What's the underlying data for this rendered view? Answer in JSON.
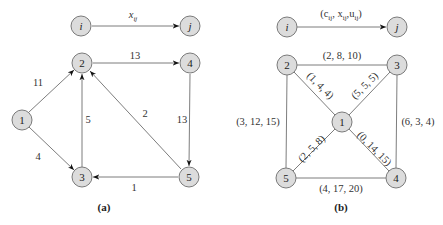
{
  "diagrams": [
    {
      "id": "a",
      "caption": "(a)",
      "legend": {
        "from": "i",
        "to": "j",
        "label": "x",
        "label_sub": "ij"
      },
      "nodes": [
        {
          "id": "1",
          "x": 22,
          "y": 120
        },
        {
          "id": "2",
          "x": 82,
          "y": 63
        },
        {
          "id": "3",
          "x": 82,
          "y": 177
        },
        {
          "id": "4",
          "x": 190,
          "y": 63
        },
        {
          "id": "5",
          "x": 189,
          "y": 177
        }
      ],
      "edges": [
        {
          "from": "1",
          "to": "2",
          "label": "11",
          "directed": true
        },
        {
          "from": "1",
          "to": "3",
          "label": "4",
          "directed": true
        },
        {
          "from": "3",
          "to": "2",
          "label": "5",
          "directed": true
        },
        {
          "from": "2",
          "to": "4",
          "label": "13",
          "directed": true
        },
        {
          "from": "5",
          "to": "2",
          "label": "2",
          "directed": true
        },
        {
          "from": "4",
          "to": "5",
          "label": "13",
          "directed": true
        },
        {
          "from": "5",
          "to": "3",
          "label": "1",
          "directed": true
        }
      ]
    },
    {
      "id": "b",
      "caption": "(b)",
      "legend": {
        "from": "i",
        "to": "j",
        "label": "(c_ij, x_ij, u_ij)",
        "parts": [
          "(c",
          "ij",
          ", x",
          "ij",
          ",u",
          "ij",
          ")"
        ]
      },
      "nodes": [
        {
          "id": "1",
          "x": 342,
          "y": 122
        },
        {
          "id": "2",
          "x": 287,
          "y": 65
        },
        {
          "id": "3",
          "x": 397,
          "y": 65
        },
        {
          "id": "4",
          "x": 396,
          "y": 178
        },
        {
          "id": "5",
          "x": 286,
          "y": 178
        }
      ],
      "edges": [
        {
          "from": "2",
          "to": "3",
          "label": "(2, 8, 10)"
        },
        {
          "from": "2",
          "to": "1",
          "label": "(1, 4, 4)"
        },
        {
          "from": "3",
          "to": "1",
          "label": "(5, 5, 5)"
        },
        {
          "from": "2",
          "to": "5",
          "label": "(3, 12, 15)"
        },
        {
          "from": "3",
          "to": "4",
          "label": "(6, 3, 4)"
        },
        {
          "from": "1",
          "to": "5",
          "label": "(2, 5, 8)"
        },
        {
          "from": "1",
          "to": "4",
          "label": "(0, 14, 15)"
        },
        {
          "from": "5",
          "to": "4",
          "label": "(4, 17, 20)"
        }
      ]
    }
  ],
  "colors": {
    "node_fill": "#dcdcdc",
    "node_stroke": "#7a7a7a",
    "edge": "#6e6e6e",
    "text": "#222222"
  }
}
